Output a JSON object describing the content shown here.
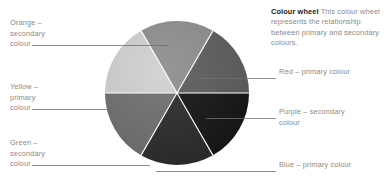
{
  "figure": {
    "background": "#ffffff"
  },
  "caption": {
    "title": "Colour wheel",
    "body": " This colour wheel represents the relationship between primary and secondary colours."
  },
  "wheel": {
    "center_x": 177,
    "center_y": 93,
    "radius": 72,
    "segment_count": 6,
    "divider_color": "#ffffff",
    "segments": [
      {
        "name": "red",
        "label": "Red – primary colour",
        "kind": "primary",
        "fill": "#5d5d5d",
        "start_angle": 0,
        "end_angle": 60
      },
      {
        "name": "purple",
        "label": "Purple – secondary colour",
        "kind": "secondary",
        "fill": "#151515",
        "start_angle": 60,
        "end_angle": 120
      },
      {
        "name": "blue",
        "label": "Blue – primary colour",
        "kind": "primary",
        "fill": "#2b2b2b",
        "start_angle": 120,
        "end_angle": 180
      },
      {
        "name": "green",
        "label": "Green – secondary colour",
        "kind": "secondary",
        "fill": "#6f6f6f",
        "start_angle": 180,
        "end_angle": 240
      },
      {
        "name": "yellow",
        "label": "Yellow – primary colour",
        "kind": "primary",
        "fill": "#d0d0d0",
        "start_angle": 240,
        "end_angle": 300
      },
      {
        "name": "orange",
        "label": "Orange – secondary colour",
        "kind": "secondary",
        "fill": "#8e8e8e",
        "start_angle": 300,
        "end_angle": 360
      }
    ]
  },
  "labels": {
    "orange": "Orange –\nsecondary\ncolour",
    "yellow": "Yellow –\nprimary\ncolour",
    "green": "Green –\nsecondary\ncolour",
    "red": "Red – primary colour",
    "purple": "Purple – secondary\ncolour",
    "blue": "Blue – primary colour"
  },
  "leader_lines": {
    "color": "#6f6f6f",
    "width": 0.8
  }
}
